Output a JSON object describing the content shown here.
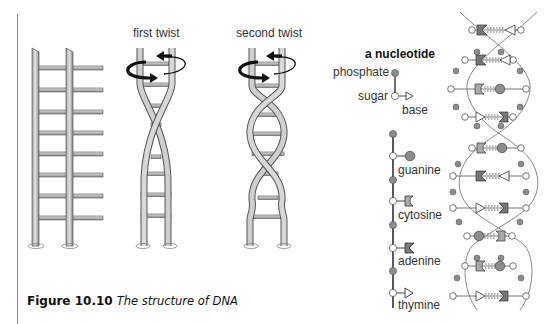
{
  "figure": {
    "caption_number": "Figure 10.10",
    "caption_text": "The structure of DNA"
  },
  "ladders": {
    "first_twist_label": "first twist",
    "second_twist_label": "second twist"
  },
  "nucleotide": {
    "title": "a nucleotide",
    "phosphate_label": "phosphate",
    "sugar_label": "sugar",
    "base_label": "base"
  },
  "bases": [
    {
      "name": "guanine",
      "shape": "circle"
    },
    {
      "name": "cytosine",
      "shape": "notch"
    },
    {
      "name": "adenine",
      "shape": "chevron"
    },
    {
      "name": "thymine",
      "shape": "triangle"
    }
  ],
  "colors": {
    "rail": "#b8b8b8",
    "rail_outline": "#555555",
    "phosphate": "#8c8c8c",
    "sugar": "#ffffff",
    "arrow": "#111111"
  }
}
